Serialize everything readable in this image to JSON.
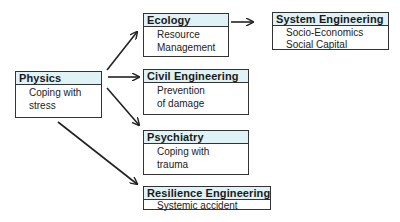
{
  "diagram": {
    "nodes": [
      {
        "id": "physics",
        "title": "Physics",
        "lines": [
          "Coping with",
          "stress"
        ]
      },
      {
        "id": "ecology",
        "title": "Ecology",
        "lines": [
          "Resource",
          "Management"
        ]
      },
      {
        "id": "system_engineering",
        "title": "System Engineering",
        "lines": [
          "Socio-Economics",
          "Social Capital"
        ]
      },
      {
        "id": "civil_engineering",
        "title": "Civil Engineering",
        "lines": [
          "Prevention",
          "of damage"
        ]
      },
      {
        "id": "psychiatry",
        "title": "Psychiatry",
        "lines": [
          "Coping with",
          "trauma"
        ]
      },
      {
        "id": "resilience_engineering",
        "title": "Resilience Engineering",
        "lines": [
          "Systemic accident"
        ]
      }
    ],
    "edges": [
      {
        "from": "physics",
        "to": "ecology"
      },
      {
        "from": "physics",
        "to": "civil_engineering"
      },
      {
        "from": "physics",
        "to": "psychiatry"
      },
      {
        "from": "physics",
        "to": "resilience_engineering"
      },
      {
        "from": "ecology",
        "to": "system_engineering"
      }
    ],
    "colors": {
      "header_fill": "#dff2f5",
      "border": "#333333",
      "arrow": "#222222"
    }
  }
}
